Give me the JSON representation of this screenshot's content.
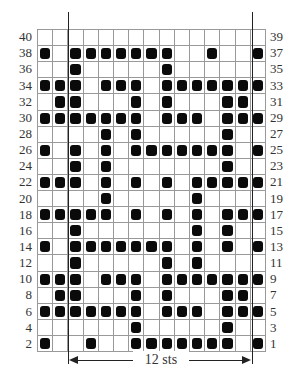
{
  "chart": {
    "columns": 15,
    "rows": 20,
    "repeat_label": "12 sts",
    "repeat_start_col": 3,
    "repeat_end_col": 14,
    "left_labels": [
      "40",
      "38",
      "36",
      "34",
      "32",
      "30",
      "28",
      "26",
      "24",
      "22",
      "20",
      "18",
      "16",
      "14",
      "12",
      "10",
      "8",
      "6",
      "4",
      "2"
    ],
    "right_labels": [
      "39",
      "37",
      "35",
      "33",
      "31",
      "29",
      "27",
      "25",
      "23",
      "21",
      "19",
      "17",
      "15",
      "13",
      "11",
      "9",
      "7",
      "5",
      "3",
      "1"
    ],
    "filled_cells": [
      [],
      [
        1,
        3,
        4,
        5,
        6,
        7,
        8,
        9,
        12,
        15
      ],
      [
        3,
        9
      ],
      [
        1,
        2,
        3,
        5,
        6,
        7,
        9,
        10,
        11,
        12,
        13,
        14,
        15
      ],
      [
        2,
        3,
        7,
        9,
        13,
        14
      ],
      [
        1,
        2,
        3,
        4,
        5,
        6,
        7,
        9,
        10,
        11,
        13,
        14,
        15
      ],
      [
        5,
        7,
        13
      ],
      [
        1,
        3,
        5,
        7,
        8,
        9,
        10,
        11,
        12,
        13,
        15
      ],
      [
        3,
        5,
        13
      ],
      [
        1,
        2,
        3,
        5,
        7,
        9,
        11,
        12,
        13,
        14,
        15
      ],
      [
        5,
        11
      ],
      [
        1,
        2,
        3,
        4,
        5,
        7,
        9,
        11,
        13,
        14,
        15
      ],
      [
        3,
        11,
        13
      ],
      [
        1,
        3,
        4,
        5,
        6,
        7,
        8,
        9,
        11,
        13,
        15
      ],
      [
        3,
        9,
        11
      ],
      [
        1,
        2,
        3,
        5,
        6,
        7,
        9,
        10,
        11,
        12,
        13,
        14,
        15
      ],
      [
        2,
        3,
        7,
        9,
        13,
        14
      ],
      [
        1,
        2,
        3,
        4,
        5,
        6,
        7,
        9,
        10,
        11,
        13,
        14,
        15
      ],
      [
        7,
        13
      ],
      [
        1,
        4,
        7,
        8,
        9,
        10,
        11,
        12,
        13,
        15
      ]
    ],
    "colors": {
      "filled": "#0a0a0a",
      "grid": "#999999",
      "background": "#ffffff"
    }
  }
}
